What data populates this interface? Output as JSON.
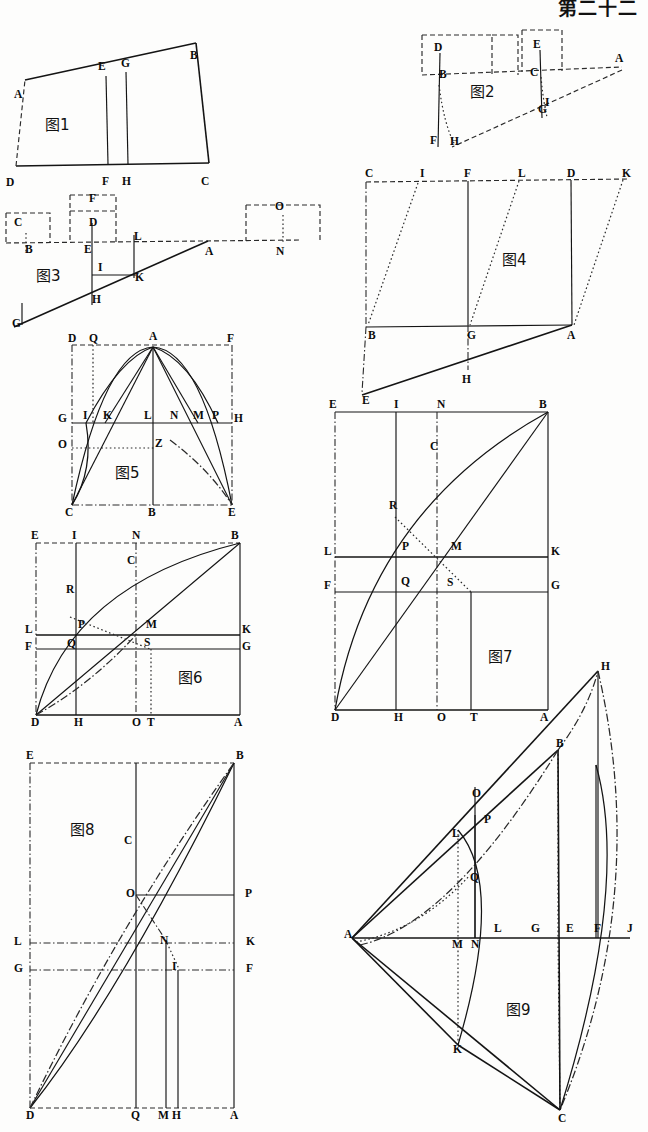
{
  "page": {
    "header": "第二十二",
    "background": "#fdfdfc",
    "ink": "#141414",
    "width": 648,
    "height": 1132,
    "kind": "scanned-geometry-plate",
    "figure_count": 9
  },
  "figures": [
    {
      "id": "fig1",
      "caption": "图1",
      "shape": "irregular-quadrilateral-with-two-verticals",
      "labels": [
        {
          "text": "A",
          "x": 16,
          "y": 73
        },
        {
          "text": "E",
          "x": 100,
          "y": 45
        },
        {
          "text": "G",
          "x": 123,
          "y": 42
        },
        {
          "text": "B",
          "x": 192,
          "y": 34
        },
        {
          "text": "D",
          "x": 8,
          "y": 161
        },
        {
          "text": "F",
          "x": 104,
          "y": 160
        },
        {
          "text": "H",
          "x": 124,
          "y": 160
        },
        {
          "text": "C",
          "x": 203,
          "y": 160
        }
      ]
    },
    {
      "id": "fig2",
      "caption": "图2",
      "shape": "lever-beam-with-two-weights-and-slant-line",
      "labels": [
        {
          "text": "D",
          "x": 434,
          "y": 51
        },
        {
          "text": "E",
          "x": 533,
          "y": 48
        },
        {
          "text": "A",
          "x": 615,
          "y": 62
        },
        {
          "text": "B",
          "x": 439,
          "y": 78
        },
        {
          "text": "C",
          "x": 530,
          "y": 76
        },
        {
          "text": "G",
          "x": 538,
          "y": 113
        },
        {
          "text": "I",
          "x": 545,
          "y": 106
        },
        {
          "text": "F",
          "x": 430,
          "y": 144
        },
        {
          "text": "H",
          "x": 450,
          "y": 145
        }
      ]
    },
    {
      "id": "fig3",
      "caption": "图3",
      "shape": "beam-with-three-boxes-and-incline",
      "labels": [
        {
          "text": "C",
          "x": 16,
          "y": 226
        },
        {
          "text": "F",
          "x": 91,
          "y": 202
        },
        {
          "text": "D",
          "x": 91,
          "y": 226
        },
        {
          "text": "O",
          "x": 277,
          "y": 210
        },
        {
          "text": "B",
          "x": 27,
          "y": 248
        },
        {
          "text": "E",
          "x": 86,
          "y": 248
        },
        {
          "text": "L",
          "x": 136,
          "y": 240
        },
        {
          "text": "A",
          "x": 207,
          "y": 250
        },
        {
          "text": "N",
          "x": 278,
          "y": 250
        },
        {
          "text": "I",
          "x": 100,
          "y": 271
        },
        {
          "text": "K",
          "x": 137,
          "y": 281
        },
        {
          "text": "H",
          "x": 94,
          "y": 303
        },
        {
          "text": "G",
          "x": 14,
          "y": 327
        }
      ]
    },
    {
      "id": "fig4",
      "caption": "图4",
      "shape": "parallelogram-grid-with-dotted-diagonals",
      "labels": [
        {
          "text": "C",
          "x": 365,
          "y": 177
        },
        {
          "text": "I",
          "x": 420,
          "y": 177
        },
        {
          "text": "F",
          "x": 464,
          "y": 177
        },
        {
          "text": "L",
          "x": 518,
          "y": 177
        },
        {
          "text": "D",
          "x": 567,
          "y": 177
        },
        {
          "text": "K",
          "x": 622,
          "y": 177
        },
        {
          "text": "B",
          "x": 368,
          "y": 327
        },
        {
          "text": "G",
          "x": 467,
          "y": 327
        },
        {
          "text": "A",
          "x": 567,
          "y": 327
        },
        {
          "text": "H",
          "x": 462,
          "y": 371
        },
        {
          "text": "E",
          "x": 362,
          "y": 392
        }
      ]
    },
    {
      "id": "fig5",
      "caption": "图5",
      "shape": "rectangle-with-parabolic-curves-and-chords",
      "labels": [
        {
          "text": "D",
          "x": 69,
          "y": 341
        },
        {
          "text": "Q",
          "x": 91,
          "y": 341
        },
        {
          "text": "A",
          "x": 151,
          "y": 339
        },
        {
          "text": "F",
          "x": 228,
          "y": 341
        },
        {
          "text": "G",
          "x": 58,
          "y": 421
        },
        {
          "text": "I",
          "x": 84,
          "y": 418
        },
        {
          "text": "K",
          "x": 105,
          "y": 418
        },
        {
          "text": "L",
          "x": 145,
          "y": 418
        },
        {
          "text": "N",
          "x": 171,
          "y": 418
        },
        {
          "text": "M",
          "x": 194,
          "y": 418
        },
        {
          "text": "P",
          "x": 213,
          "y": 418
        },
        {
          "text": "H",
          "x": 232,
          "y": 421
        },
        {
          "text": "O",
          "x": 58,
          "y": 447
        },
        {
          "text": "Z",
          "x": 155,
          "y": 446
        },
        {
          "text": "C",
          "x": 66,
          "y": 508
        },
        {
          "text": "B",
          "x": 148,
          "y": 508
        },
        {
          "text": "E",
          "x": 227,
          "y": 508
        }
      ]
    },
    {
      "id": "fig6",
      "caption": "图6",
      "shape": "rectangle-with-arc-chords-and-cross-lines",
      "labels": [
        {
          "text": "E",
          "x": 33,
          "y": 538
        },
        {
          "text": "I",
          "x": 74,
          "y": 538
        },
        {
          "text": "N",
          "x": 134,
          "y": 538
        },
        {
          "text": "B",
          "x": 233,
          "y": 538
        },
        {
          "text": "C",
          "x": 129,
          "y": 563
        },
        {
          "text": "R",
          "x": 68,
          "y": 592
        },
        {
          "text": "P",
          "x": 80,
          "y": 627
        },
        {
          "text": "M",
          "x": 148,
          "y": 627
        },
        {
          "text": "L",
          "x": 27,
          "y": 632
        },
        {
          "text": "K",
          "x": 242,
          "y": 632
        },
        {
          "text": "Q",
          "x": 69,
          "y": 646
        },
        {
          "text": "S",
          "x": 146,
          "y": 645
        },
        {
          "text": "F",
          "x": 27,
          "y": 649
        },
        {
          "text": "G",
          "x": 242,
          "y": 649
        },
        {
          "text": "D",
          "x": 33,
          "y": 719
        },
        {
          "text": "H",
          "x": 76,
          "y": 719
        },
        {
          "text": "O",
          "x": 134,
          "y": 719
        },
        {
          "text": "T",
          "x": 149,
          "y": 719
        },
        {
          "text": "A",
          "x": 236,
          "y": 719
        }
      ]
    },
    {
      "id": "fig7",
      "caption": "图7",
      "shape": "rectangle-with-arc-chords-and-cross-lines-large",
      "labels": [
        {
          "text": "E",
          "x": 329,
          "y": 413
        },
        {
          "text": "I",
          "x": 394,
          "y": 413
        },
        {
          "text": "N",
          "x": 437,
          "y": 413
        },
        {
          "text": "B",
          "x": 539,
          "y": 413
        },
        {
          "text": "C",
          "x": 430,
          "y": 455
        },
        {
          "text": "R",
          "x": 389,
          "y": 514
        },
        {
          "text": "P",
          "x": 402,
          "y": 555
        },
        {
          "text": "M",
          "x": 451,
          "y": 555
        },
        {
          "text": "L",
          "x": 324,
          "y": 562
        },
        {
          "text": "K",
          "x": 551,
          "y": 562
        },
        {
          "text": "Q",
          "x": 401,
          "y": 590
        },
        {
          "text": "S",
          "x": 447,
          "y": 591
        },
        {
          "text": "F",
          "x": 324,
          "y": 594
        },
        {
          "text": "G",
          "x": 551,
          "y": 594
        },
        {
          "text": "D",
          "x": 331,
          "y": 718
        },
        {
          "text": "H",
          "x": 394,
          "y": 718
        },
        {
          "text": "O",
          "x": 437,
          "y": 718
        },
        {
          "text": "T",
          "x": 470,
          "y": 718
        },
        {
          "text": "A",
          "x": 540,
          "y": 718
        }
      ]
    },
    {
      "id": "fig8",
      "caption": "图8",
      "shape": "tall-rectangle-with-arc-and-chords",
      "labels": [
        {
          "text": "E",
          "x": 28,
          "y": 757
        },
        {
          "text": "B",
          "x": 239,
          "y": 757
        },
        {
          "text": "C",
          "x": 127,
          "y": 842
        },
        {
          "text": "O",
          "x": 130,
          "y": 895
        },
        {
          "text": "P",
          "x": 249,
          "y": 895
        },
        {
          "text": "L",
          "x": 18,
          "y": 943
        },
        {
          "text": "N",
          "x": 164,
          "y": 942
        },
        {
          "text": "K",
          "x": 250,
          "y": 943
        },
        {
          "text": "G",
          "x": 18,
          "y": 970
        },
        {
          "text": "I",
          "x": 176,
          "y": 968
        },
        {
          "text": "F",
          "x": 250,
          "y": 970
        },
        {
          "text": "D",
          "x": 28,
          "y": 1117
        },
        {
          "text": "Q",
          "x": 131,
          "y": 1117
        },
        {
          "text": "M",
          "x": 162,
          "y": 1117
        },
        {
          "text": "H",
          "x": 176,
          "y": 1117
        },
        {
          "text": "A",
          "x": 242,
          "y": 1117
        }
      ]
    },
    {
      "id": "fig9",
      "caption": "图9",
      "shape": "lens-vesica-with-chords-and-verticals",
      "labels": [
        {
          "text": "H",
          "x": 601,
          "y": 670
        },
        {
          "text": "B",
          "x": 556,
          "y": 747
        },
        {
          "text": "O",
          "x": 472,
          "y": 797
        },
        {
          "text": "P",
          "x": 484,
          "y": 823
        },
        {
          "text": "L",
          "x": 458,
          "y": 837
        },
        {
          "text": "Q",
          "x": 470,
          "y": 881
        },
        {
          "text": "A",
          "x": 350,
          "y": 938
        },
        {
          "text": "M",
          "x": 453,
          "y": 944
        },
        {
          "text": "N",
          "x": 474,
          "y": 944
        },
        {
          "text": "L",
          "x": 494,
          "y": 932
        },
        {
          "text": "G",
          "x": 531,
          "y": 932
        },
        {
          "text": "E",
          "x": 566,
          "y": 932
        },
        {
          "text": "F",
          "x": 594,
          "y": 932
        },
        {
          "text": "J",
          "x": 626,
          "y": 932
        },
        {
          "text": "K",
          "x": 458,
          "y": 1049
        },
        {
          "text": "C",
          "x": 562,
          "y": 1120
        }
      ]
    }
  ]
}
